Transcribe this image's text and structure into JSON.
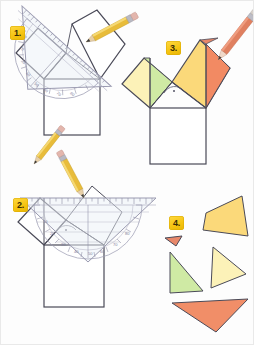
{
  "page": {
    "width": 254,
    "height": 345,
    "background": "#fdfdfd"
  },
  "palette": {
    "outline": "#4a4a58",
    "outline_dark": "#333340",
    "pale_yellow": "#fdf3bd",
    "yellow": "#fbd97a",
    "deep_yellow": "#f9cf6b",
    "green": "#cce9a0",
    "orange": "#f59472",
    "salmon": "#f28a63",
    "pencil_yellow": "#e8bc3a",
    "pencil_orange": "#e08060",
    "badge_yellow": "#f5c310",
    "ruler_edge": "#9a9ab0"
  },
  "panels": [
    {
      "id": "panel-1",
      "badge": "1.",
      "caption": "Step 1: draw the base square and the two tilted squares, measure the right angle with the geometry triangle",
      "tools": [
        "geometry-triangle-ruler",
        "pencil"
      ]
    },
    {
      "id": "panel-3",
      "badge": "3.",
      "caption": "Step 3: colour the squares and mark the right angle",
      "tools": [
        "pencil"
      ]
    },
    {
      "id": "panel-2",
      "badge": "2.",
      "caption": "Step 2: align the geometry triangle along the top edge and mark the angle",
      "tools": [
        "geometry-triangle-ruler",
        "pencil"
      ]
    },
    {
      "id": "panel-4",
      "badge": "4.",
      "caption": "Step 4: the cut-out triangle pieces",
      "tools": []
    }
  ],
  "panel4_triangles": [
    {
      "name": "triangle-tiny-red",
      "fill": "#e8886a",
      "label": "tiny"
    },
    {
      "name": "triangle-large-yellow",
      "fill": "#fbd97a",
      "label": "large"
    },
    {
      "name": "triangle-green",
      "fill": "#cfeaa4",
      "label": "green"
    },
    {
      "name": "triangle-pale-yellow",
      "fill": "#fcf2b8",
      "label": "pale"
    },
    {
      "name": "triangle-orange",
      "fill": "#f18e68",
      "label": "orange"
    }
  ],
  "ruler": {
    "name": "geometry-triangle",
    "tick_count": 22,
    "protractor_marks": 19,
    "body_fill": "rgba(238,242,248,0.55)"
  }
}
